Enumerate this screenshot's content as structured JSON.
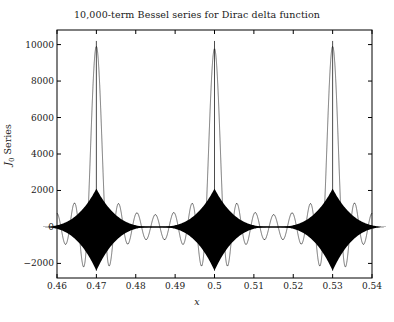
{
  "chart_data": {
    "type": "line",
    "title": "10,000-term Bessel series for Dirac delta function",
    "xlabel": "x",
    "ylabel": "J0 Series",
    "ylabel_base": "J",
    "ylabel_sub": "0",
    "ylabel_rest": " Series",
    "xlim": [
      0.46,
      0.54
    ],
    "ylim": [
      -2800,
      10800
    ],
    "grid": false,
    "legend": null,
    "xticks": [
      0.46,
      0.47,
      0.48,
      0.49,
      0.5,
      0.51,
      0.52,
      0.53,
      0.54
    ],
    "xtick_labels": [
      "0.46",
      "0.47",
      "0.48",
      "0.49",
      "0.5",
      "0.51",
      "0.52",
      "0.53",
      "0.54"
    ],
    "yticks": [
      -2000,
      0,
      2000,
      4000,
      6000,
      8000,
      10000
    ],
    "ytick_labels": [
      "-2000",
      "0",
      "2000",
      "4000",
      "6000",
      "8000",
      "10000"
    ],
    "series": [
      {
        "name": "J0 Series",
        "color": "#000000",
        "description": "Highly oscillatory 10,000-term Bessel J0 series approximating a Dirac comb; near-zero ringing baseline punctuated by three sharp delta spikes.",
        "spikes": [
          {
            "x": 0.47,
            "peak": 10200,
            "undershoot": -2400
          },
          {
            "x": 0.5,
            "peak": 10200,
            "undershoot": -2400
          },
          {
            "x": 0.53,
            "peak": 10200,
            "undershoot": -2400
          }
        ],
        "baseline_value": 0,
        "baseline_ripple_amplitude": 120,
        "spike_halfwidth": 0.0022
      }
    ]
  },
  "figure": {
    "background_color": "#ffffff",
    "axes_color": "#000000",
    "line_color": "#000000"
  }
}
